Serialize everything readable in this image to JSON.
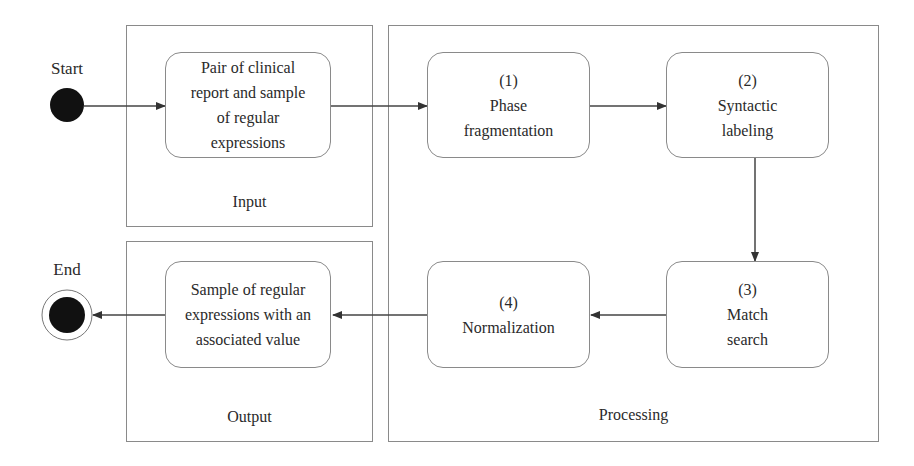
{
  "diagram": {
    "type": "activity-diagram",
    "start": {
      "label": "Start"
    },
    "end": {
      "label": "End"
    },
    "lanes": {
      "input": {
        "label": "Input"
      },
      "processing": {
        "label": "Processing"
      },
      "output": {
        "label": "Output"
      }
    },
    "nodes": {
      "input_node": {
        "text": "Pair of clinical\nreport and sample\nof regular\nexpressions"
      },
      "step1": {
        "text": "(1)\nPhase\nfragmentation"
      },
      "step2": {
        "text": "(2)\nSyntactic\nlabeling"
      },
      "step3": {
        "text": "(3)\nMatch\nsearch"
      },
      "step4": {
        "text": "(4)\nNormalization"
      },
      "output_node": {
        "text": "Sample of regular\nexpressions with an\nassociated value"
      }
    },
    "edges": [
      {
        "from": "start",
        "to": "input_node"
      },
      {
        "from": "input_node",
        "to": "step1"
      },
      {
        "from": "step1",
        "to": "step2"
      },
      {
        "from": "step2",
        "to": "step3"
      },
      {
        "from": "step3",
        "to": "step4"
      },
      {
        "from": "step4",
        "to": "output_node"
      },
      {
        "from": "output_node",
        "to": "end"
      }
    ]
  }
}
